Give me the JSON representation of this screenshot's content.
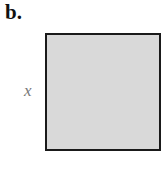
{
  "panel": {
    "label": "b."
  },
  "figure": {
    "shape": "square",
    "fill_color": "#d9d9d9",
    "border_color": "#1a1a1a",
    "side_label": "x"
  }
}
